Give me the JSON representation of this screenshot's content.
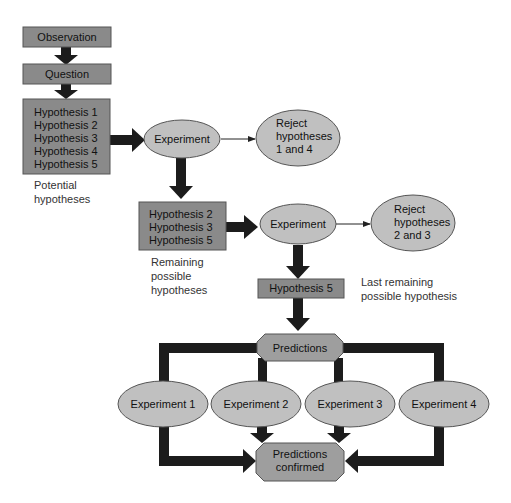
{
  "diagram": {
    "nodes": {
      "observation": "Observation",
      "question": "Question",
      "hypotheses_all": [
        "Hypothesis 1",
        "Hypothesis 2",
        "Hypothesis 3",
        "Hypothesis 4",
        "Hypothesis 5"
      ],
      "experiment_1": "Experiment",
      "reject_1": [
        "Reject",
        "hypotheses",
        "1 and 4"
      ],
      "hypotheses_remaining": [
        "Hypothesis 2",
        "Hypothesis 3",
        "Hypothesis 5"
      ],
      "experiment_2": "Experiment",
      "reject_2": [
        "Reject",
        "hypotheses",
        "2 and 3"
      ],
      "hypothesis_last": "Hypothesis 5",
      "predictions": "Predictions",
      "experiments": [
        "Experiment 1",
        "Experiment 2",
        "Experiment 3",
        "Experiment 4"
      ],
      "predictions_confirmed": [
        "Predictions",
        "confirmed"
      ]
    },
    "notes": {
      "potential": [
        "Potential",
        "hypotheses"
      ],
      "remaining": [
        "Remaining",
        "possible",
        "hypotheses"
      ],
      "last": [
        "Last remaining",
        "possible hypothesis"
      ]
    },
    "colors": {
      "box": "#8a8a8a",
      "oval": "#c0c0c0",
      "octagon": "#9e9e9e",
      "arrow": "#1c1c1c"
    }
  }
}
